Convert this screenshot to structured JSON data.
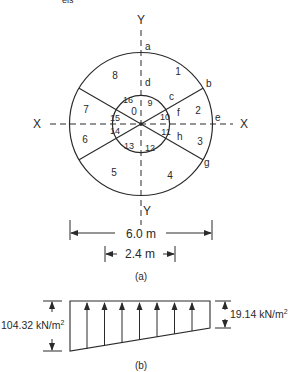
{
  "figure": {
    "partial_caption_top": "eis",
    "part_a": {
      "caption": "(a)",
      "axes": {
        "x_left": "X",
        "x_right": "X",
        "y_top": "Y",
        "y_bottom": "Y"
      },
      "points": {
        "a": "a",
        "b": "b",
        "c": "c",
        "d": "d",
        "e": "e",
        "f": "f",
        "g": "g",
        "h": "h"
      },
      "outer_segments": [
        "1",
        "2",
        "3",
        "4",
        "5",
        "6",
        "7",
        "8"
      ],
      "inner_segments": [
        "9",
        "10",
        "11",
        "12",
        "13",
        "14",
        "15",
        "16"
      ],
      "center_label": "0",
      "dimensions": {
        "outer": "6.0 m",
        "inner": "2.4 m"
      }
    },
    "part_b": {
      "caption": "(b)",
      "left_pressure": "104.32 kN/m",
      "right_pressure": "19.14 kN/m",
      "unit_exponent": "2"
    },
    "colors": {
      "line": "#2a2a2a",
      "background": "#ffffff"
    }
  }
}
